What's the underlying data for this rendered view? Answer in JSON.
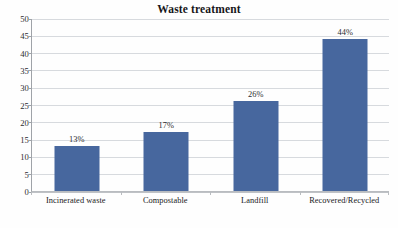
{
  "chart_data": {
    "type": "bar",
    "title": "Waste treatment",
    "xlabel": "",
    "ylabel": "",
    "categories": [
      "Incinerated waste",
      "Compostable",
      "Landfill",
      "Recovered/Recycled"
    ],
    "values": [
      13,
      17,
      26,
      44
    ],
    "data_labels": [
      "13%",
      "17%",
      "26%",
      "44%"
    ],
    "ylim": [
      0,
      50
    ],
    "ytick_values": [
      0,
      5,
      10,
      15,
      20,
      25,
      30,
      35,
      40,
      45,
      50
    ],
    "ytick_labels": [
      "0",
      "5",
      "10",
      "15",
      "20",
      "25",
      "30",
      "35",
      "40",
      "45",
      "50"
    ],
    "grid": true,
    "legend": false,
    "legend_position": "none",
    "series": [
      {
        "name": "Waste treatment",
        "values": [
          13,
          17,
          26,
          44
        ],
        "color": "#47679E"
      }
    ],
    "colors": {
      "bar": "#47679E",
      "gridline": "#D7DADE",
      "axis": "#9FA3A8",
      "text": "#2B2B2E",
      "background": "#FEFEFE"
    }
  }
}
